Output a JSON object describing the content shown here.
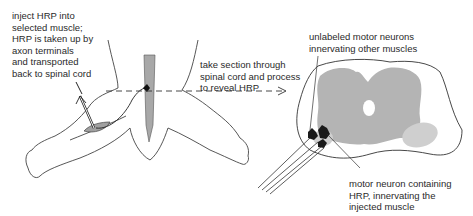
{
  "labels": {
    "inject": "inject HRP into\nselected muscle;\nHRP is taken up by\naxon terminals\nand transported\nback to spinal cord",
    "section": "take section through\nspinal cord and process\nto reveal HRP",
    "unlabeled": "unlabeled motor neurons\ninnervating other muscles",
    "labeled": "motor neuron containing\nHRP, innervating the\ninjected muscle"
  },
  "colors": {
    "gray_matter": "#b4b4b4",
    "ventral_horn_light": "#cfcfcf",
    "outline": "#333333",
    "neuron": "#1a1a1a"
  }
}
